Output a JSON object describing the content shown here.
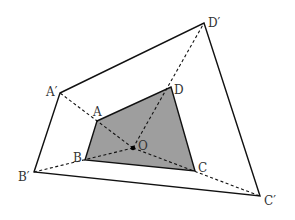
{
  "diagram": {
    "type": "homothety",
    "colors": {
      "stroke": "#111111",
      "fill_inner": "#9e9e9e",
      "background": "#ffffff",
      "label": "#333333"
    },
    "center": {
      "label": "O",
      "x": 133,
      "y": 148
    },
    "inner_quad": {
      "vertices": [
        {
          "label": "A",
          "x": 97,
          "y": 121,
          "lx": 93,
          "ly": 116
        },
        {
          "label": "B",
          "x": 85,
          "y": 160,
          "lx": 73,
          "ly": 162
        },
        {
          "label": "C",
          "x": 195,
          "y": 171,
          "lx": 198,
          "ly": 172
        },
        {
          "label": "D",
          "x": 171,
          "y": 87,
          "lx": 174,
          "ly": 94
        }
      ]
    },
    "outer_quad": {
      "vertices": [
        {
          "label": "A′",
          "x": 60,
          "y": 93,
          "lx": 46,
          "ly": 96
        },
        {
          "label": "B′",
          "x": 34,
          "y": 172,
          "lx": 18,
          "ly": 181
        },
        {
          "label": "C′",
          "x": 260,
          "y": 196,
          "lx": 264,
          "ly": 205
        },
        {
          "label": "D′",
          "x": 204,
          "y": 23,
          "lx": 208,
          "ly": 27
        }
      ]
    }
  }
}
